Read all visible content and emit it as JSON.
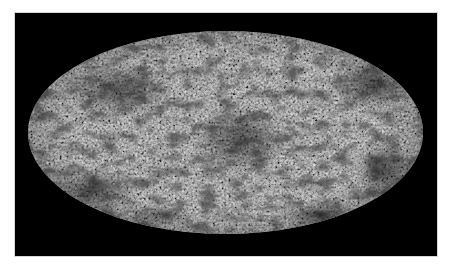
{
  "image": {
    "subject": "all-sky-map",
    "projection": "mollweide-ellipse",
    "colormap": "grayscale",
    "background_color": "#ffffff",
    "frame_color": "#000000",
    "map_base_color": "#7c7c7c",
    "dark_feature_color": "#1a1a1a",
    "bright_feature_color": "#e8e8e8",
    "frame": {
      "x": 15,
      "y": 13,
      "width": 422,
      "height": 243
    },
    "ellipse": {
      "cx": 225.5,
      "cy": 132.5,
      "rx": 197.5,
      "ry": 101.5
    }
  }
}
